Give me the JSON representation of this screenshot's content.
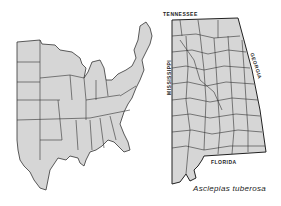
{
  "figure": {
    "species_caption": "Asclepias tuberosa",
    "colors": {
      "fill": "#d6d6d6",
      "border": "#333333",
      "background": "#ffffff"
    }
  },
  "us_map": {
    "description": "Eastern United States with state boundaries, shaded distribution"
  },
  "state_map": {
    "state": "Alabama",
    "description": "County map, all counties shaded",
    "border_labels": {
      "north": "TENNESSEE",
      "east": "GEORGIA",
      "south": "FLORIDA",
      "west": "MISSISSIPPI"
    }
  }
}
